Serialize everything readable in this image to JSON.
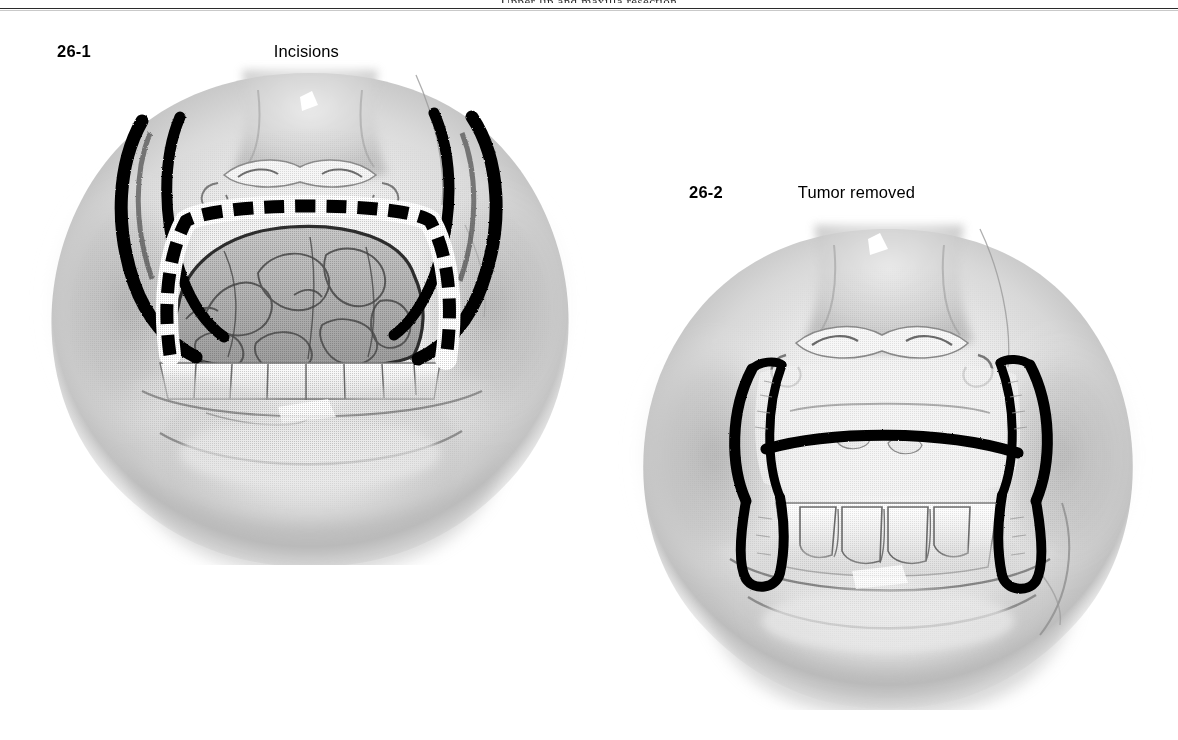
{
  "page": {
    "running_head": "Upper lip and maxilla resection",
    "background_color": "#ffffff",
    "ink_color": "#000000",
    "rule_color": "#2b2b2b"
  },
  "figures": [
    {
      "number": "26-1",
      "caption": "Incisions",
      "subject": "lower face with nose, upper lip and lobulated maxillary tumor exposed; bold black bilateral alar-base / nasolabial incision lines and a dashed black incision outline around the tumor above the upper teeth",
      "style": "grayscale halftone medical illustration",
      "markings": [
        {
          "name": "left-alar-incision",
          "type": "solid-bold-curve"
        },
        {
          "name": "right-alar-incision",
          "type": "solid-bold-curve"
        },
        {
          "name": "tumor-resection-outline",
          "type": "dashed-bold-line"
        },
        {
          "name": "tumor-mass",
          "type": "lobulated-shaded-mass"
        },
        {
          "name": "upper-teeth",
          "type": "tooth-row"
        }
      ]
    },
    {
      "number": "26-2",
      "caption": "Tumor removed",
      "subject": "same lower face after resection; bold black bracket-shaped outline delineates the surgical defect over the maxilla with upper teeth visible below",
      "style": "grayscale halftone medical illustration",
      "markings": [
        {
          "name": "left-defect-margin",
          "type": "solid-bold-curve"
        },
        {
          "name": "right-defect-margin",
          "type": "solid-bold-curve"
        },
        {
          "name": "horizontal-defect-margin",
          "type": "solid-bold-line"
        },
        {
          "name": "upper-teeth",
          "type": "tooth-row"
        }
      ]
    }
  ]
}
